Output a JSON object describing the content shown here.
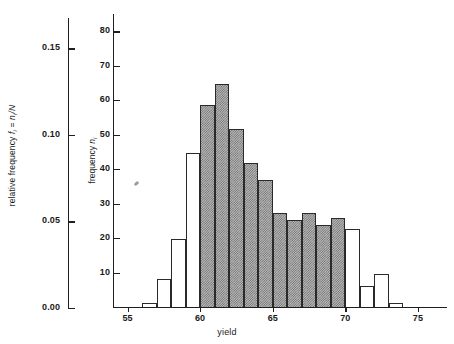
{
  "chart_data": {
    "type": "bar",
    "title": "",
    "xlabel": "yield",
    "ylabel": "frequency n_i",
    "y2label": "relative frequency f_i = n_i/N",
    "xlim": [
      54,
      77
    ],
    "ylim": [
      0,
      85
    ],
    "y2lim": [
      0,
      0.17
    ],
    "grid": false,
    "legend": null,
    "bin_width": 1,
    "categories": [
      "56",
      "57",
      "58",
      "59",
      "60",
      "61",
      "62",
      "63",
      "64",
      "65",
      "66",
      "67",
      "68",
      "69",
      "70",
      "71",
      "72",
      "73"
    ],
    "bin_starts": [
      56,
      57,
      58,
      59,
      60,
      61,
      62,
      63,
      64,
      65,
      66,
      67,
      68,
      69,
      70,
      71,
      72,
      73
    ],
    "values": [
      1.5,
      8.5,
      20,
      45,
      59,
      65,
      52,
      42,
      37,
      27.5,
      25.5,
      27.5,
      24,
      26,
      23,
      6.5,
      10,
      1.5
    ],
    "highlighted": [
      false,
      false,
      false,
      false,
      true,
      true,
      true,
      true,
      true,
      true,
      true,
      true,
      true,
      true,
      false,
      false,
      false,
      false
    ],
    "highlight_note": "shaded bins span yield 60 to 70"
  },
  "axes": {
    "relative_frequency": {
      "label_prefix": "relative frequency ",
      "label_symbol": "f",
      "label_sub": "i",
      "label_eq": " = ",
      "label_num": "n",
      "label_num_sub": "i",
      "label_den": "/N",
      "ticks": [
        {
          "value": 0.0,
          "label": "0.00"
        },
        {
          "value": 0.05,
          "label": "0.05"
        },
        {
          "value": 0.1,
          "label": "0.10"
        },
        {
          "value": 0.15,
          "label": "0.15"
        }
      ]
    },
    "frequency": {
      "label_prefix": "frequency ",
      "label_symbol": "n",
      "label_sub": "i",
      "ticks": [
        {
          "value": 10,
          "label": "10"
        },
        {
          "value": 20,
          "label": "20"
        },
        {
          "value": 30,
          "label": "30"
        },
        {
          "value": 40,
          "label": "40"
        },
        {
          "value": 50,
          "label": "50"
        },
        {
          "value": 60,
          "label": "60"
        },
        {
          "value": 70,
          "label": "70"
        },
        {
          "value": 80,
          "label": "80"
        }
      ]
    },
    "yield": {
      "label": "yield",
      "ticks": [
        {
          "value": 55,
          "label": "55"
        },
        {
          "value": 60,
          "label": "60"
        },
        {
          "value": 65,
          "label": "65"
        },
        {
          "value": 70,
          "label": "70"
        },
        {
          "value": 75,
          "label": "75"
        }
      ]
    }
  },
  "colors": {
    "axis": "#1f1f1f",
    "bar_outline": "#2a2a2a",
    "bar_fill_plain": "#ffffff",
    "bar_fill_hatched": "#b9b9b9",
    "background": "#ffffff"
  }
}
